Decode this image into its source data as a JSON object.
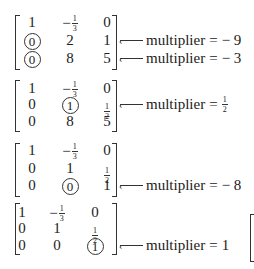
{
  "matrices": [
    {
      "rows": [
        [
          {
            "v": "1"
          },
          {
            "v": "−",
            "frac": [
              "1",
              "3"
            ]
          },
          {
            "v": "0"
          }
        ],
        [
          {
            "v": "0",
            "circled": true
          },
          {
            "v": "2"
          },
          {
            "v": "1"
          }
        ],
        [
          {
            "v": "0",
            "circled": true
          },
          {
            "v": "8"
          },
          {
            "v": "5"
          }
        ]
      ],
      "annotations": [
        {
          "row": 1,
          "label": "multiplier",
          "eq": "=",
          "value": "− 9"
        },
        {
          "row": 2,
          "label": "multiplier",
          "eq": "=",
          "value": "− 3"
        }
      ]
    },
    {
      "rows": [
        [
          {
            "v": "1"
          },
          {
            "v": "−",
            "frac": [
              "1",
              "3"
            ]
          },
          {
            "v": "0"
          }
        ],
        [
          {
            "v": "0"
          },
          {
            "v": "1",
            "circled": true
          },
          {
            "frac": [
              "1",
              "2"
            ]
          }
        ],
        [
          {
            "v": "0"
          },
          {
            "v": "8"
          },
          {
            "v": "5"
          }
        ]
      ],
      "annotations": [
        {
          "row": 1,
          "label": "multiplier",
          "eq": "=",
          "frac": [
            "1",
            "2"
          ]
        }
      ]
    },
    {
      "rows": [
        [
          {
            "v": "1"
          },
          {
            "v": "−",
            "frac": [
              "1",
              "3"
            ]
          },
          {
            "v": "0"
          }
        ],
        [
          {
            "v": "0"
          },
          {
            "v": "1"
          },
          {
            "frac": [
              "1",
              "2"
            ]
          }
        ],
        [
          {
            "v": "0"
          },
          {
            "v": "0",
            "circled": true
          },
          {
            "v": "1"
          }
        ]
      ],
      "annotations": [
        {
          "row": 2,
          "label": "multiplier",
          "eq": "=",
          "value": "− 8"
        }
      ]
    },
    {
      "rows": [
        [
          {
            "v": "1"
          },
          {
            "v": "−",
            "frac": [
              "1",
              "3"
            ]
          },
          {
            "v": "0"
          }
        ],
        [
          {
            "v": "0"
          },
          {
            "v": "1"
          },
          {
            "frac": [
              "1",
              "2"
            ]
          }
        ],
        [
          {
            "v": "0"
          },
          {
            "v": "0"
          },
          {
            "v": "1",
            "circled": true
          }
        ]
      ],
      "annotations": [
        {
          "row": 2,
          "label": "multiplier",
          "eq": "=",
          "value": "1"
        }
      ]
    }
  ]
}
